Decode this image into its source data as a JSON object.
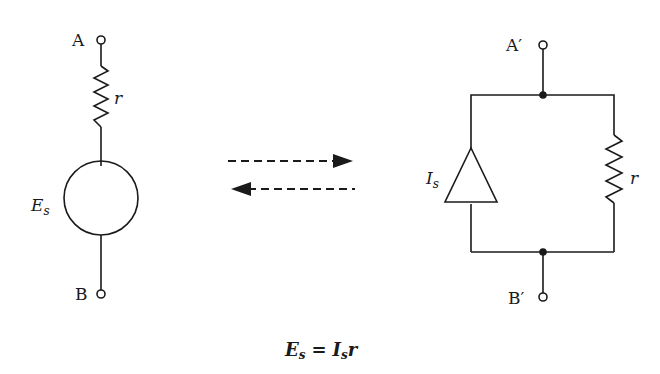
{
  "colors": {
    "ink": "#1a1a1a",
    "background": "#ffffff"
  },
  "left_circuit": {
    "terminal_top": "A",
    "terminal_bottom": "B",
    "resistor_label": "r",
    "source_label": "E",
    "source_subscript": "s",
    "source_type": "voltage-source-circle"
  },
  "arrows": {
    "forward": "dashed-arrow-right",
    "backward": "dashed-arrow-left"
  },
  "right_circuit": {
    "terminal_top": "A′",
    "terminal_bottom": "B′",
    "resistor_label": "r",
    "source_label": "I",
    "source_subscript": "s",
    "source_type": "current-source-triangle"
  },
  "equation": {
    "lhs": "E",
    "lhs_sub": "s",
    "equals": "=",
    "rhs": "I",
    "rhs_sub": "s",
    "rhs_tail": "r"
  }
}
